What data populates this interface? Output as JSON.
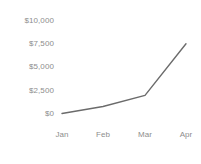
{
  "chart_data": {
    "type": "line",
    "title": "",
    "subtitle": "",
    "xlabel": "",
    "ylabel": "",
    "categories": [
      "Jan",
      "Feb",
      "Mar",
      "Apr"
    ],
    "series": [
      {
        "name": "",
        "values": [
          0,
          750,
          1950,
          7500
        ],
        "color": "#6b6b6b"
      }
    ],
    "ylim": [
      0,
      10000
    ],
    "y_ticks": [
      0,
      2500,
      5000,
      7500,
      10000
    ],
    "y_tick_labels": [
      "$0",
      "$2,500",
      "$5,000",
      "$7,500",
      "$10,000"
    ],
    "x_tick_labels": [
      "Jan",
      "Feb",
      "Mar",
      "Apr"
    ],
    "grid": false,
    "legend": false,
    "legend_position": "none",
    "background_color": "#ffffff",
    "tick_label_color": "#8d8d8d",
    "line_color": "#6b6b6b",
    "line_width": 1.4,
    "markers": false
  },
  "axis": {
    "y": {
      "labels": [
        {
          "text": "$10,000",
          "top": 16
        },
        {
          "text": "$7,500",
          "top": 39
        },
        {
          "text": "$5,000",
          "top": 62
        },
        {
          "text": "$2,500",
          "top": 86
        },
        {
          "text": "$0",
          "top": 109
        }
      ]
    },
    "x": {
      "labels": [
        {
          "text": "Jan",
          "left": 62
        },
        {
          "text": "Feb",
          "left": 103
        },
        {
          "text": "Mar",
          "left": 145
        },
        {
          "text": "Apr",
          "left": 186
        }
      ]
    }
  }
}
